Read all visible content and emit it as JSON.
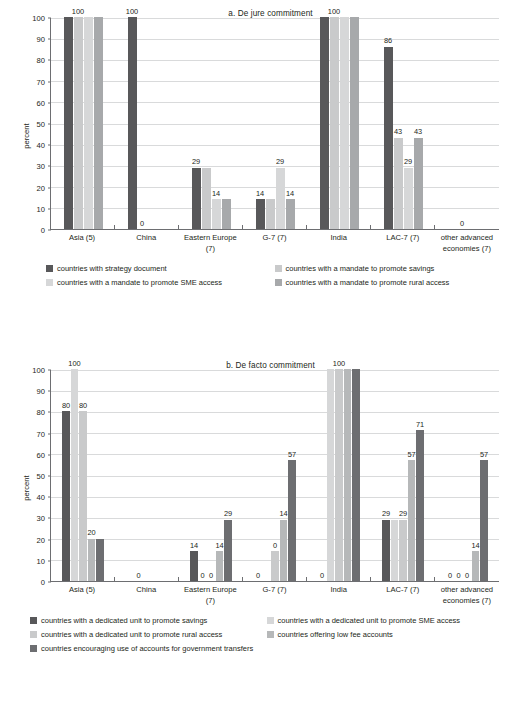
{
  "figure": {
    "panels": [
      "a",
      "b"
    ]
  },
  "chart_data": [
    {
      "type": "bar",
      "title": "a. De jure commitment",
      "xlabel": "",
      "ylabel": "percent",
      "ylim": [
        0,
        100
      ],
      "yticks": [
        0,
        10,
        20,
        30,
        40,
        50,
        60,
        70,
        80,
        90,
        100
      ],
      "grid": true,
      "legend_position": "bottom",
      "categories": [
        "Asia (5)",
        "China",
        "Eastern Europe (7)",
        "G-7 (7)",
        "India",
        "LAC-7 (7)",
        "other advanced economies (7)"
      ],
      "series": [
        {
          "name": "countries with strategy document",
          "color": "#58585a",
          "values": [
            100,
            100,
            29,
            14,
            100,
            86,
            0
          ]
        },
        {
          "name": "countries with a mandate to promote savings",
          "color": "#c9cacb",
          "values": [
            100,
            0,
            29,
            14,
            100,
            43,
            0
          ]
        },
        {
          "name": "countries with a mandate to promote SME access",
          "color": "#d6d7d8",
          "values": [
            100,
            0,
            14,
            29,
            100,
            29,
            0
          ]
        },
        {
          "name": "countries with a mandate to promote rural access",
          "color": "#a7a9ab",
          "values": [
            100,
            0,
            14,
            14,
            100,
            43,
            0
          ]
        }
      ],
      "data_labels": {
        "Asia (5)": [
          "",
          "100",
          "",
          ""
        ],
        "China": [
          "100",
          "0",
          "",
          ""
        ],
        "Eastern Europe (7)": [
          "29",
          "",
          "14",
          ""
        ],
        "G-7 (7)": [
          "14",
          "",
          "29",
          "14"
        ],
        "India": [
          "",
          "100",
          "",
          ""
        ],
        "LAC-7 (7)": [
          "86",
          "43",
          "29",
          "43"
        ],
        "other advanced economies (7)": [
          "",
          "0",
          "",
          ""
        ]
      }
    },
    {
      "type": "bar",
      "title": "b. De facto commitment",
      "xlabel": "",
      "ylabel": "percent",
      "ylim": [
        0,
        100
      ],
      "yticks": [
        0,
        10,
        20,
        30,
        40,
        50,
        60,
        70,
        80,
        90,
        100
      ],
      "grid": true,
      "legend_position": "bottom",
      "categories": [
        "Asia (5)",
        "China",
        "Eastern Europe (7)",
        "G-7 (7)",
        "India",
        "LAC-7 (7)",
        "other advanced economies (7)"
      ],
      "series": [
        {
          "name": "countries with a dedicated unit to promote savings",
          "color": "#58585a",
          "values": [
            80,
            0,
            14,
            0,
            0,
            29,
            0
          ]
        },
        {
          "name": "countries with a dedicated unit to promote SME access",
          "color": "#d6d7d8",
          "values": [
            100,
            0,
            0,
            0,
            100,
            29,
            0
          ]
        },
        {
          "name": "countries with a dedicated unit to promote rural access",
          "color": "#c9cacb",
          "values": [
            80,
            0,
            0,
            14,
            100,
            29,
            0
          ]
        },
        {
          "name": "countries offering low fee accounts",
          "color": "#b6b8b9",
          "values": [
            20,
            0,
            14,
            29,
            100,
            57,
            14
          ]
        },
        {
          "name": "countries encouraging use of accounts for government transfers",
          "color": "#6d6e71",
          "values": [
            20,
            0,
            29,
            57,
            100,
            71,
            57
          ]
        }
      ],
      "data_labels": {
        "Asia (5)": [
          "80",
          "100",
          "80",
          "20",
          ""
        ],
        "China": [
          "",
          "0",
          "",
          "",
          ""
        ],
        "Eastern Europe (7)": [
          "14",
          "0",
          "0",
          "14",
          "29"
        ],
        "G-7 (7)": [
          "0",
          "",
          "0",
          "14",
          "57"
        ],
        "India": [
          "0",
          "",
          "100",
          "",
          ""
        ],
        "LAC-7 (7)": [
          "29",
          "",
          "29",
          "57",
          "71"
        ],
        "other advanced economies (7)": [
          "0",
          "0",
          "0",
          "14",
          "57"
        ]
      }
    }
  ]
}
